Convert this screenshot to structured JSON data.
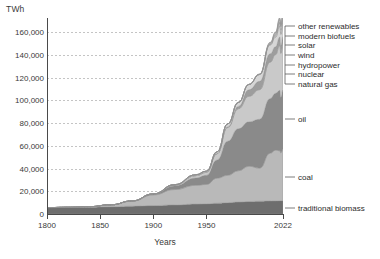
{
  "chart_data": {
    "type": "area",
    "title": "",
    "subtitle": "",
    "xlabel": "Years",
    "ylabel": "TWh",
    "unit_label": "TWh",
    "xlim": [
      1800,
      2022
    ],
    "ylim": [
      0,
      170000
    ],
    "grid": true,
    "stacked": true,
    "legend_position": "right",
    "x_ticks": [
      "1800",
      "1850",
      "1900",
      "1950",
      "2022"
    ],
    "x_tick_values": [
      1800,
      1850,
      1900,
      1950,
      2022
    ],
    "y_ticks": [
      "0",
      "20,000",
      "40,000",
      "60,000",
      "80,000",
      "100,000",
      "120,000",
      "140,000",
      "160,000"
    ],
    "y_tick_values": [
      0,
      20000,
      40000,
      60000,
      80000,
      100000,
      120000,
      140000,
      160000
    ],
    "x": [
      1800,
      1820,
      1840,
      1860,
      1880,
      1900,
      1920,
      1940,
      1950,
      1960,
      1970,
      1980,
      1990,
      2000,
      2010,
      2015,
      2019,
      2020,
      2022
    ],
    "series": [
      {
        "name": "traditional biomass",
        "color": "#6e6e6e",
        "values": [
          5560,
          5750,
          6000,
          6400,
          6900,
          7400,
          8000,
          8700,
          9000,
          9500,
          10000,
          10500,
          11000,
          11300,
          11500,
          11600,
          11700,
          11700,
          11700
        ]
      },
      {
        "name": "coal",
        "color": "#b9b9b9",
        "values": [
          97,
          200,
          500,
          1700,
          4400,
          9400,
          13500,
          16500,
          17000,
          22000,
          24000,
          27500,
          31000,
          29000,
          42000,
          44500,
          44000,
          42000,
          45500
        ]
      },
      {
        "name": "oil",
        "color": "#8a8a8a",
        "values": [
          0,
          0,
          0,
          0,
          200,
          700,
          3200,
          6500,
          8000,
          16000,
          30000,
          37000,
          39000,
          43000,
          48000,
          50000,
          53000,
          49000,
          52000
        ]
      },
      {
        "name": "natural gas",
        "color": "#c9c9c9",
        "values": [
          0,
          0,
          0,
          0,
          0,
          100,
          700,
          2000,
          2700,
          5500,
          12000,
          17500,
          22500,
          26000,
          32000,
          34000,
          39500,
          38500,
          40000
        ]
      },
      {
        "name": "nuclear",
        "color": "#9d9d9d",
        "values": [
          0,
          0,
          0,
          0,
          0,
          0,
          0,
          0,
          0,
          100,
          700,
          2100,
          5700,
          7300,
          7400,
          6900,
          7300,
          7000,
          7000
        ]
      },
      {
        "name": "hydropower",
        "color": "#d6d6d6",
        "values": [
          0,
          0,
          0,
          0,
          0,
          100,
          400,
          800,
          1000,
          1600,
          2500,
          3500,
          4700,
          6000,
          7700,
          8500,
          9500,
          9700,
          10000
        ]
      },
      {
        "name": "wind",
        "color": "#bfbfbf",
        "values": [
          0,
          0,
          0,
          0,
          0,
          0,
          0,
          0,
          0,
          0,
          0,
          0,
          10,
          90,
          900,
          2000,
          3600,
          4200,
          5400
        ]
      },
      {
        "name": "solar",
        "color": "#e0e0e0",
        "values": [
          0,
          0,
          0,
          0,
          0,
          0,
          0,
          0,
          0,
          0,
          0,
          0,
          0,
          5,
          90,
          700,
          1900,
          2300,
          3200
        ]
      },
      {
        "name": "modern biofuels",
        "color": "#cfcfcf",
        "values": [
          0,
          0,
          0,
          0,
          0,
          0,
          0,
          0,
          0,
          0,
          0,
          0,
          100,
          250,
          800,
          1050,
          1200,
          1150,
          1250
        ]
      },
      {
        "name": "other renewables",
        "color": "#a8a8a8",
        "values": [
          0,
          0,
          0,
          0,
          0,
          0,
          0,
          0,
          0,
          0,
          0,
          10,
          100,
          250,
          600,
          900,
          1300,
          1400,
          1550
        ]
      }
    ],
    "legend_right": [
      {
        "label": "other renewables",
        "y_px": 26
      },
      {
        "label": "modern biofuels",
        "y_px": 36
      },
      {
        "label": "solar",
        "y_px": 45
      },
      {
        "label": "wind",
        "y_px": 55
      },
      {
        "label": "hydropower",
        "y_px": 65
      },
      {
        "label": "nuclear",
        "y_px": 74
      },
      {
        "label": "natural gas",
        "y_px": 84
      },
      {
        "label": "oil",
        "y_px": 119
      },
      {
        "label": "coal",
        "y_px": 177
      },
      {
        "label": "traditional biomass",
        "y_px": 208
      }
    ],
    "colors": {
      "axis": "#4a4a4a",
      "grid": "#b9b9b9",
      "text": "#2b2b2b",
      "background": "#ffffff"
    }
  }
}
